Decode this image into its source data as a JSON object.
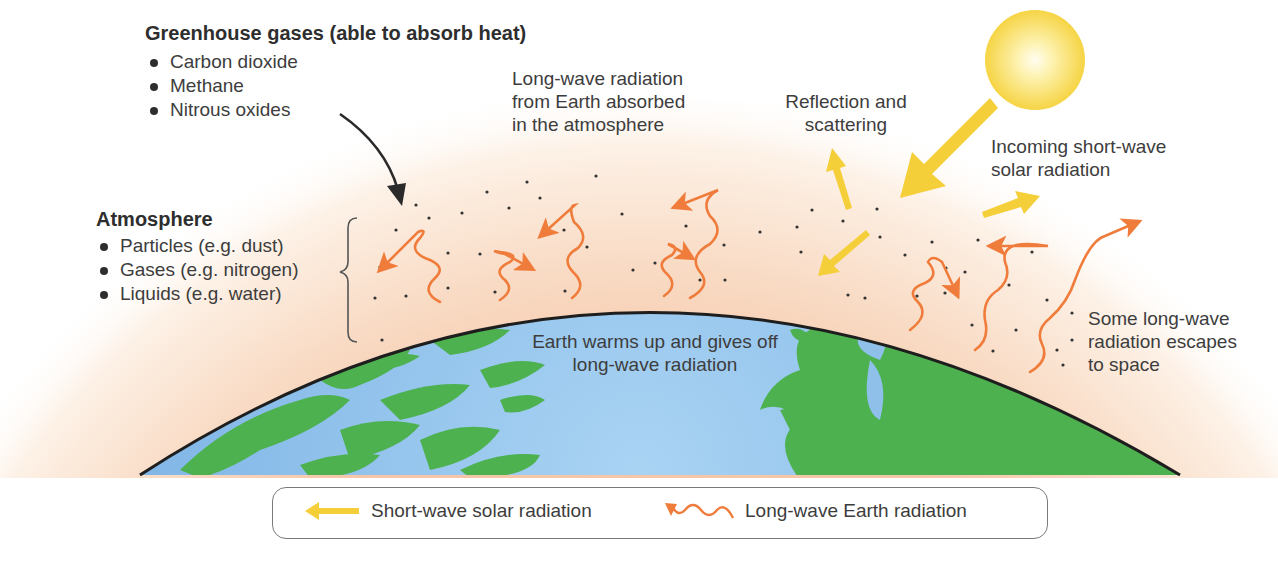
{
  "greenhouse_gases": {
    "heading": "Greenhouse gases (able to absorb heat)",
    "items": [
      "Carbon dioxide",
      "Methane",
      "Nitrous oxides"
    ]
  },
  "atmosphere": {
    "heading": "Atmosphere",
    "items": [
      "Particles (e.g. dust)",
      "Gases (e.g. nitrogen)",
      "Liquids (e.g. water)"
    ]
  },
  "annotations": {
    "absorbed": [
      "Long-wave radiation",
      "from Earth absorbed",
      "in the atmosphere"
    ],
    "reflection": [
      "Reflection and",
      "scattering"
    ],
    "incoming": [
      "Incoming short-wave",
      "solar radiation"
    ],
    "earth_warms": [
      "Earth warms up and gives off",
      "long-wave radiation"
    ],
    "escapes": [
      "Some long-wave",
      "radiation escapes",
      "to space"
    ]
  },
  "legend": {
    "short_wave": "Short-wave solar radiation",
    "long_wave": "Long-wave Earth radiation"
  },
  "colors": {
    "sun": "#f7d84a",
    "short_wave_arrow": "#f5cf3a",
    "long_wave_arrow": "#f07c3c",
    "atmosphere": "#f8d4bd",
    "ocean": "#8ec0ea",
    "land": "#4caf50",
    "text": "#3d3d3d"
  }
}
